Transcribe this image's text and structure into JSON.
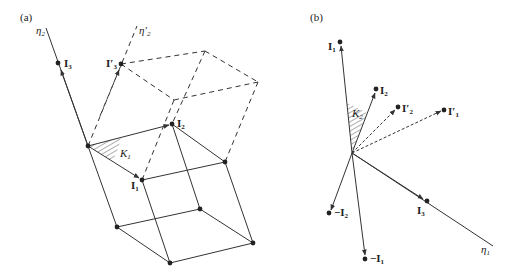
{
  "panels": [
    {
      "tag": "(a)",
      "axes": {
        "eta2": "η",
        "eta2_sub": "2",
        "eta2p": "η′",
        "eta2p_sub": "2"
      },
      "vectors": {
        "I1": {
          "name": "I",
          "sub": "1"
        },
        "I2": {
          "name": "I",
          "sub": "2"
        },
        "I3": {
          "name": "I",
          "sub": "3"
        },
        "I3p": {
          "name": "I′",
          "sub": "3"
        }
      },
      "angle": {
        "name": "K",
        "sub": "1"
      }
    },
    {
      "tag": "(b)",
      "axes": {
        "eta1": "η",
        "eta1_sub": "1"
      },
      "vectors": {
        "I1": {
          "name": "I",
          "sub": "1"
        },
        "I2": {
          "name": "I",
          "sub": "2"
        },
        "I3": {
          "name": "I",
          "sub": "3"
        },
        "I1p": {
          "name": "I′",
          "sub": "1"
        },
        "I2p": {
          "name": "I′",
          "sub": "2"
        },
        "negI1": {
          "name": "−I",
          "sub": "1"
        },
        "negI2": {
          "name": "−I",
          "sub": "2"
        }
      },
      "angle": {
        "name": "K",
        "sub": "2"
      }
    }
  ],
  "colors": {
    "stroke": "#333333",
    "background": "#ffffff"
  }
}
